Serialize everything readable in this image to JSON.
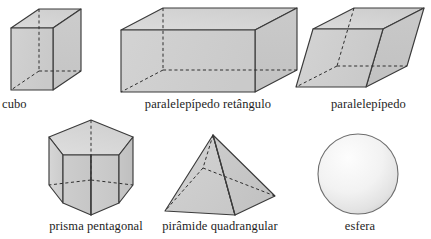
{
  "figure": {
    "language": "pt-BR",
    "style": {
      "fill_light": "#d9d9d9",
      "fill_mid": "#cfcfcf",
      "fill_dark": "#c2c2c2",
      "stroke": "#3b3b3b",
      "hidden_stroke": "#2e2e2e",
      "background": "#ffffff",
      "label_color": "#1d1d1d"
    },
    "rows": [
      {
        "row": 1,
        "items": [
          {
            "id": "cubo",
            "label": "cubo",
            "shape": "cube",
            "faces_visible": 3,
            "hidden_edges": 3
          },
          {
            "id": "paralelepipedo-retangulo",
            "label": "paralelepípedo retângulo",
            "shape": "rectangular-prism",
            "faces_visible": 3,
            "hidden_edges": 3
          },
          {
            "id": "paralelepipedo",
            "label": "paralelepípedo",
            "shape": "oblique-parallelepiped",
            "faces_visible": 3,
            "hidden_edges": 3
          }
        ]
      },
      {
        "row": 2,
        "items": [
          {
            "id": "prisma-pentagonal",
            "label": "prisma pentagonal",
            "shape": "pentagonal-prism",
            "faces_visible": 4,
            "hidden_edges": 4
          },
          {
            "id": "piramide-quadrangular",
            "label": "pirâmide quadrangular",
            "shape": "square-pyramid",
            "faces_visible": 2,
            "hidden_edges": 3
          },
          {
            "id": "esfera",
            "label": "esfera",
            "shape": "sphere",
            "faces_visible": 1,
            "hidden_edges": 0
          }
        ]
      }
    ]
  }
}
